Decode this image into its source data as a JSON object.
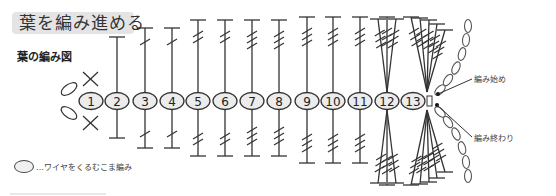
{
  "title": "葉を編み進める",
  "subtitle": "葉の編み図",
  "legend": {
    "symbol": "oval",
    "text": "…ワイヤをくるむこま編み"
  },
  "labels": {
    "start": "編み始め",
    "end": "編み終わり"
  },
  "stitches": [
    {
      "n": "1",
      "x": 91,
      "type": "single-crochet-x",
      "top": null,
      "bottom": null
    },
    {
      "n": "2",
      "x": 117,
      "type": "half-double",
      "crosses": 0,
      "top": 37,
      "bottom": 138
    },
    {
      "n": "3",
      "x": 145,
      "type": "double",
      "crosses": 1,
      "top": 28,
      "bottom": 148
    },
    {
      "n": "4",
      "x": 172,
      "type": "double",
      "crosses": 1,
      "top": 28,
      "bottom": 148
    },
    {
      "n": "5",
      "x": 198,
      "type": "treble",
      "crosses": 2,
      "top": 20,
      "bottom": 156
    },
    {
      "n": "6",
      "x": 225,
      "type": "treble",
      "crosses": 2,
      "top": 20,
      "bottom": 156
    },
    {
      "n": "7",
      "x": 252,
      "type": "triple-treble",
      "crosses": 3,
      "top": 20,
      "bottom": 156
    },
    {
      "n": "8",
      "x": 279,
      "type": "triple-treble",
      "crosses": 3,
      "top": 20,
      "bottom": 156
    },
    {
      "n": "9",
      "x": 307,
      "type": "triple-treble",
      "crosses": 3,
      "top": 17,
      "bottom": 163
    },
    {
      "n": "10",
      "x": 333,
      "type": "triple-treble",
      "crosses": 3,
      "top": 17,
      "bottom": 163
    },
    {
      "n": "11",
      "x": 360,
      "type": "triple-treble",
      "crosses": 3,
      "top": 17,
      "bottom": 163
    },
    {
      "n": "12",
      "x": 387,
      "type": "fan-3",
      "crosses": 3,
      "top": 17,
      "bottom": 163
    },
    {
      "n": "13",
      "x": 413,
      "type": "fan-5",
      "crosses": 3,
      "top": 17,
      "bottom": 163
    }
  ],
  "colors": {
    "line": "#333333",
    "oval_fill": "#ececec",
    "title_bg": "#e4e4e4"
  }
}
